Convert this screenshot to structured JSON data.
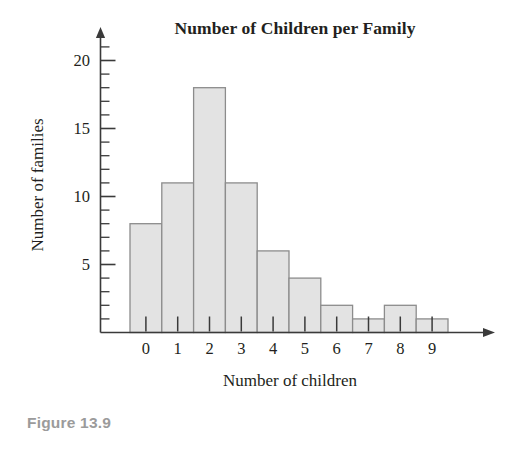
{
  "figure": {
    "caption": "Figure 13.9"
  },
  "chart_data": {
    "type": "bar",
    "title": "Number of Children per Family",
    "xlabel": "Number of children",
    "ylabel": "Number of families",
    "categories": [
      "0",
      "1",
      "2",
      "3",
      "4",
      "5",
      "6",
      "7",
      "8",
      "9"
    ],
    "values": [
      8,
      11,
      18,
      11,
      6,
      4,
      2,
      1,
      2,
      1
    ],
    "total_families": 64,
    "ylim": [
      0,
      21
    ],
    "xlim": [
      -0.5,
      9.5
    ],
    "y_major_ticks": [
      5,
      10,
      15,
      20
    ],
    "y_major_tick_labels": [
      "5",
      "10",
      "15",
      "20"
    ],
    "y_minor_tick_interval": 1,
    "grid": false,
    "legend": false,
    "legend_position": "none",
    "axis_style": "arrow-ended",
    "x_tick_style": "inside-bars",
    "bar_gap": 0,
    "colors": {
      "bar_fill": "#e3e3e3",
      "bar_edge": "#8c8c8c",
      "axis": "#3a3a3a",
      "text": "#231f20",
      "caption": "#9b9b9b",
      "background": "#ffffff"
    }
  }
}
